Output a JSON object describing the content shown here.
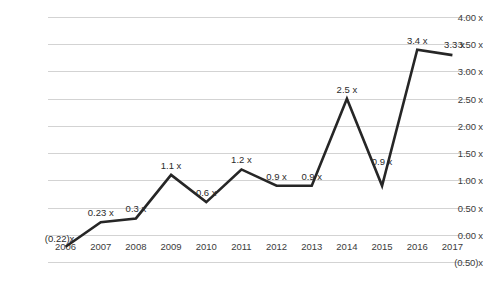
{
  "chart_data": {
    "type": "line",
    "title": "",
    "subtitle": "",
    "xlabel": "",
    "ylabel": "",
    "categories": [
      "2006",
      "2007",
      "2008",
      "2009",
      "2010",
      "2011",
      "2012",
      "2013",
      "2014",
      "2015",
      "2016",
      "2017"
    ],
    "values": [
      -0.22,
      0.23,
      0.3,
      1.1,
      0.6,
      1.2,
      0.9,
      0.9,
      2.5,
      0.9,
      3.4,
      3.3
    ],
    "point_labels": [
      "(0.22)x",
      "0.23 x",
      "0.3 x",
      "1.1 x",
      "0.6 x",
      "1.2 x",
      "0.9 x",
      "0.9 x",
      "2.5 x",
      "0.9 x",
      "3.4 x",
      "3.3 x"
    ],
    "ylim": [
      -0.5,
      4.0
    ],
    "ytick_values": [
      4.0,
      3.5,
      3.0,
      2.5,
      2.0,
      1.5,
      1.0,
      0.5,
      0.0,
      -0.5
    ],
    "ytick_labels": [
      "4.00 x",
      "3.50 x",
      "3.00 x",
      "2.50 x",
      "2.00 x",
      "1.50 x",
      "1.00 x",
      "0.50 x",
      "0.00 x",
      "(0.50)x"
    ],
    "grid": true,
    "legend": "none",
    "series": [
      {
        "name": "Leverage multiple",
        "values": [
          -0.22,
          0.23,
          0.3,
          1.1,
          0.6,
          1.2,
          0.9,
          0.9,
          2.5,
          0.9,
          3.4,
          3.3
        ]
      }
    ],
    "colors": {
      "line": "#262626",
      "gridline": "#d3d3d3",
      "text": "#3b3b3b",
      "background": "#ffffff"
    }
  },
  "caption": {
    "text": ""
  }
}
